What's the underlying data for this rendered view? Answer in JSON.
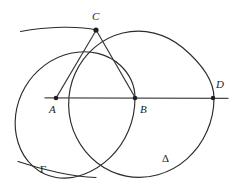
{
  "figure": {
    "background_color": "#ffffff",
    "ink_color": "#2b2b2b",
    "width": 239,
    "height": 194
  },
  "labels": {
    "point_a": "A",
    "point_b": "B",
    "point_c": "C",
    "point_d": "D",
    "arc_gamma": "Γ",
    "arc_delta": "Δ"
  },
  "points": [
    {
      "name": "A",
      "label": "A",
      "x": 56,
      "y": 98,
      "label_x": 50,
      "label_y": 112
    },
    {
      "name": "B",
      "label": "B",
      "x": 135,
      "y": 98,
      "label_x": 140,
      "label_y": 112
    },
    {
      "name": "C",
      "label": "C",
      "x": 96,
      "y": 30,
      "label_x": 92,
      "label_y": 19
    },
    {
      "name": "D",
      "label": "D",
      "x": 213,
      "y": 98,
      "label_x": 216,
      "label_y": 87
    }
  ],
  "circles": [
    {
      "name": "circle-centered-a",
      "center": "A",
      "cx": 56,
      "cy": 98,
      "r": 79
    },
    {
      "name": "circle-centered-b",
      "center": "B",
      "cx": 135,
      "cy": 98,
      "r": 79
    }
  ],
  "arcs": [
    {
      "name": "upper-left-arc",
      "center": "D",
      "through": "C",
      "radius": 157
    },
    {
      "name": "lower-left-arc-gamma",
      "label": "Γ",
      "radius": 160
    }
  ],
  "segments": [
    {
      "name": "baseline-AD",
      "from": "A",
      "to": "D"
    },
    {
      "name": "chord-CA",
      "from": "C",
      "to": "A"
    },
    {
      "name": "chord-CB",
      "from": "C",
      "to": "B"
    }
  ]
}
